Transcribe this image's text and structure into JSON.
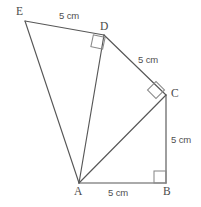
{
  "figure": {
    "background_color": "#ffffff",
    "line_color": "#575757",
    "angle_mark_color": "#8a8a8a",
    "label_color": "#4a4a4a",
    "vertices": [
      {
        "name": "A",
        "label": "A",
        "x": 79,
        "y": 183,
        "label_x": 74,
        "label_y": 186
      },
      {
        "name": "B",
        "label": "B",
        "x": 166,
        "y": 183,
        "label_x": 163,
        "label_y": 186
      },
      {
        "name": "C",
        "label": "C",
        "x": 166,
        "y": 95,
        "label_x": 171,
        "label_y": 88
      },
      {
        "name": "D",
        "label": "D",
        "x": 104,
        "y": 35,
        "label_x": 100,
        "label_y": 21
      },
      {
        "name": "E",
        "label": "E",
        "x": 25,
        "y": 21,
        "label_x": 16,
        "label_y": 6
      }
    ],
    "segments": [
      {
        "name": "segment-AB",
        "from": "A",
        "to": "B"
      },
      {
        "name": "segment-BC",
        "from": "B",
        "to": "C"
      },
      {
        "name": "segment-AC",
        "from": "A",
        "to": "C"
      },
      {
        "name": "segment-CD",
        "from": "C",
        "to": "D"
      },
      {
        "name": "segment-AD",
        "from": "A",
        "to": "D"
      },
      {
        "name": "segment-DE",
        "from": "D",
        "to": "E"
      },
      {
        "name": "segment-AE",
        "from": "A",
        "to": "E"
      }
    ],
    "length_labels": [
      {
        "name": "length-label-DE",
        "segment": "DE",
        "text": "5 cm",
        "x": 59,
        "y": 11
      },
      {
        "name": "length-label-DC",
        "segment": "DC",
        "text": "5 cm",
        "x": 138,
        "y": 55
      },
      {
        "name": "length-label-CB",
        "segment": "CB",
        "text": "5 cm",
        "x": 171,
        "y": 135
      },
      {
        "name": "length-label-AB",
        "segment": "AB",
        "text": "5 cm",
        "x": 108,
        "y": 188
      }
    ],
    "right_angles": [
      {
        "name": "right-angle-B",
        "at": "B",
        "style": "square",
        "rotation": 0,
        "size": 12,
        "cx": 160,
        "cy": 177
      },
      {
        "name": "right-angle-C",
        "at": "C",
        "style": "diamond",
        "rotation": 45,
        "size": 12,
        "cx": 156,
        "cy": 90
      },
      {
        "name": "right-angle-D",
        "at": "D",
        "style": "square",
        "rotation": 12,
        "size": 12,
        "cx": 98,
        "cy": 42
      }
    ]
  }
}
